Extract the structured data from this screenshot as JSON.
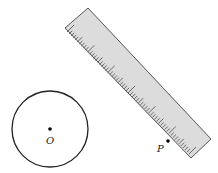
{
  "figure": {
    "circle": {
      "center_label": "O",
      "cx": 50,
      "cy": 129,
      "r": 38
    },
    "point": {
      "label": "P",
      "x": 168,
      "y": 141
    },
    "ruler": {
      "corners": [
        [
          65,
          28
        ],
        [
          88,
          8
        ],
        [
          211,
          139
        ],
        [
          191,
          158
        ]
      ],
      "fill": "#dcdcdc",
      "tick_count": 60
    }
  }
}
